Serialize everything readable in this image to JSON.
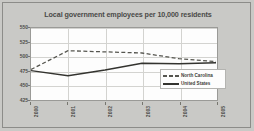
{
  "chart_data": {
    "type": "line",
    "title": "Local government employees per 10,000 residents",
    "xlabel": "",
    "ylabel": "",
    "x": [
      "2000",
      "2001",
      "2002",
      "2003",
      "2004",
      "2005"
    ],
    "categories": [
      "2000",
      "2001",
      "2002",
      "2003",
      "2004",
      "2005"
    ],
    "series": [
      {
        "name": "North Carolina",
        "style": "dashed",
        "color": "#55554f",
        "values": [
          477,
          510,
          508,
          506,
          496,
          491
        ]
      },
      {
        "name": "United States",
        "style": "solid",
        "color": "#33332f",
        "values": [
          475,
          466,
          476,
          488,
          487,
          489
        ]
      }
    ],
    "ylim": [
      425,
      550
    ],
    "yticks": [
      550,
      525,
      500,
      475,
      450,
      425
    ],
    "ytick_labels": [
      "550",
      "525",
      "500",
      "475",
      "450",
      "425"
    ],
    "xtick_labels": [
      "2000",
      "2001",
      "2002",
      "2003",
      "2004",
      "2005"
    ],
    "grid": true,
    "legend_position": "center-right",
    "legend": [
      "North Carolina",
      "United States"
    ],
    "background_color": "#c9c9c6",
    "plot_background_color": "#fdfdfd"
  }
}
